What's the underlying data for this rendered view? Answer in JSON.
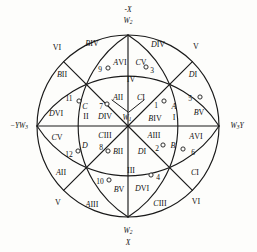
{
  "figure": {
    "type": "stereographic-projection-diagram",
    "shape": "circle with two perpendicular diameters, four diagonal radii and four great-circle arcs",
    "center_label": "W1",
    "colors": {
      "stroke": "#1a1a1a",
      "background": "#fdfdfb",
      "text": "#111111"
    }
  },
  "axes": [
    {
      "name": "top-axis",
      "line1": "-X",
      "line2": "W2"
    },
    {
      "name": "bottom-axis",
      "line1": "W2",
      "line2": "X"
    },
    {
      "name": "left-axis",
      "text": "-YW3"
    },
    {
      "name": "right-axis",
      "text": "W3Y"
    }
  ],
  "center": {
    "label": "W",
    "sub": "1"
  },
  "outer_ring_labels": [
    {
      "id": "o-vi-tl",
      "text": "VI",
      "x": 57,
      "y": 48
    },
    {
      "id": "o-biv",
      "text": "BIV",
      "x": 92,
      "y": 44,
      "italic_prefix": "B",
      "roman": "IV"
    },
    {
      "id": "o-div",
      "text": "DIV",
      "x": 158,
      "y": 45,
      "italic_prefix": "D",
      "roman": "IV"
    },
    {
      "id": "o-v-tr",
      "text": "V",
      "x": 196,
      "y": 47
    },
    {
      "id": "o-bii",
      "text": "BII",
      "x": 62,
      "y": 75,
      "italic_prefix": "B",
      "roman": "II"
    },
    {
      "id": "o-di",
      "text": "DI",
      "x": 193,
      "y": 75,
      "italic_prefix": "D",
      "roman": "I"
    },
    {
      "id": "o-dvi",
      "text": "DVI",
      "x": 56,
      "y": 114,
      "italic_prefix": "D",
      "roman": "VI"
    },
    {
      "id": "o-bv",
      "text": "BV",
      "x": 199,
      "y": 113,
      "italic_prefix": "B",
      "roman": "V"
    },
    {
      "id": "o-cv-l",
      "text": "CV",
      "x": 57,
      "y": 138,
      "italic_prefix": "C",
      "roman": "V"
    },
    {
      "id": "o-avi-r",
      "text": "AVI",
      "x": 196,
      "y": 137,
      "italic_prefix": "A",
      "roman": "VI"
    },
    {
      "id": "o-aii",
      "text": "AII",
      "x": 61,
      "y": 173,
      "italic_prefix": "A",
      "roman": "II"
    },
    {
      "id": "o-ci",
      "text": "CI",
      "x": 195,
      "y": 173,
      "italic_prefix": "C",
      "roman": "I"
    },
    {
      "id": "o-v-bl",
      "text": "V",
      "x": 58,
      "y": 203
    },
    {
      "id": "o-aiii",
      "text": "AIII",
      "x": 92,
      "y": 205,
      "italic_prefix": "A",
      "roman": "III"
    },
    {
      "id": "o-ciii-br",
      "text": "CIII",
      "x": 160,
      "y": 204,
      "italic_prefix": "C",
      "roman": "III"
    },
    {
      "id": "o-vi-br",
      "text": "VI",
      "x": 196,
      "y": 202
    }
  ],
  "inner_labels": [
    {
      "id": "i-avi",
      "text": "AVI",
      "x": 120,
      "y": 63,
      "italic_prefix": "A",
      "roman": "VI"
    },
    {
      "id": "i-cv",
      "text": "CV",
      "x": 141,
      "y": 63,
      "italic_prefix": "C",
      "roman": "V"
    },
    {
      "id": "i-iv",
      "text": "IV",
      "x": 131,
      "y": 80
    },
    {
      "id": "i-aii",
      "text": "AII",
      "x": 118,
      "y": 98,
      "italic_prefix": "A",
      "roman": "II"
    },
    {
      "id": "i-ci",
      "text": "CI",
      "x": 141,
      "y": 98,
      "italic_prefix": "C",
      "roman": "I"
    },
    {
      "id": "i-c",
      "text": "C",
      "x": 85,
      "y": 107,
      "italic_prefix": "C",
      "roman": ""
    },
    {
      "id": "i-a",
      "text": "A",
      "x": 174,
      "y": 107,
      "italic_prefix": "A",
      "roman": ""
    },
    {
      "id": "i-ii",
      "text": "II",
      "x": 86,
      "y": 117
    },
    {
      "id": "i-i",
      "text": "I",
      "x": 174,
      "y": 118
    },
    {
      "id": "i-div",
      "text": "DIV",
      "x": 105,
      "y": 117,
      "italic_prefix": "D",
      "roman": "IV"
    },
    {
      "id": "i-biv",
      "text": "BIV",
      "x": 155,
      "y": 119,
      "italic_prefix": "B",
      "roman": "IV"
    },
    {
      "id": "i-ciii",
      "text": "CIII",
      "x": 105,
      "y": 136,
      "italic_prefix": "C",
      "roman": "III"
    },
    {
      "id": "i-aiii",
      "text": "AIII",
      "x": 154,
      "y": 136,
      "italic_prefix": "A",
      "roman": "III"
    },
    {
      "id": "i-bii",
      "text": "BII",
      "x": 118,
      "y": 152,
      "italic_prefix": "B",
      "roman": "II"
    },
    {
      "id": "i-di",
      "text": "DI",
      "x": 142,
      "y": 152,
      "italic_prefix": "D",
      "roman": "I"
    },
    {
      "id": "i-d",
      "text": "D",
      "x": 85,
      "y": 146,
      "italic_prefix": "D",
      "roman": ""
    },
    {
      "id": "i-b",
      "text": "B",
      "x": 173,
      "y": 146,
      "italic_prefix": "B",
      "roman": ""
    },
    {
      "id": "i-iii",
      "text": "III",
      "x": 131,
      "y": 171
    },
    {
      "id": "i-bv",
      "text": "BV",
      "x": 119,
      "y": 190,
      "italic_prefix": "B",
      "roman": "V"
    },
    {
      "id": "i-dvi",
      "text": "DVI",
      "x": 142,
      "y": 189,
      "italic_prefix": "D",
      "roman": "VI"
    }
  ],
  "tick_marks": [
    {
      "number": "1",
      "nx": 156,
      "ny": 106,
      "cx": 164,
      "cy": 101
    },
    {
      "number": "2",
      "nx": 157,
      "ny": 149,
      "cx": 163,
      "cy": 145
    },
    {
      "number": "3",
      "nx": 152,
      "ny": 71,
      "cx": 146,
      "cy": 67
    },
    {
      "number": "4",
      "nx": 158,
      "ny": 178,
      "cx": 151,
      "cy": 175
    },
    {
      "number": "5",
      "nx": 190,
      "ny": 99,
      "cx": 200,
      "cy": 97
    },
    {
      "number": "6",
      "nx": 193,
      "ny": 153,
      "cx": 183,
      "cy": 149
    },
    {
      "number": "7",
      "nx": 101,
      "ny": 107,
      "cx": 107,
      "cy": 104
    },
    {
      "number": "8",
      "nx": 101,
      "ny": 148,
      "cx": 108,
      "cy": 151
    },
    {
      "number": "9",
      "nx": 100,
      "ny": 70,
      "cx": 108,
      "cy": 68
    },
    {
      "number": "10",
      "nx": 100,
      "ny": 182,
      "cx": 109,
      "cy": 180
    },
    {
      "number": "11",
      "nx": 69,
      "ny": 99,
      "cx": 79,
      "cy": 101
    },
    {
      "number": "12",
      "nx": 69,
      "ny": 155,
      "cx": 78,
      "cy": 151
    }
  ]
}
